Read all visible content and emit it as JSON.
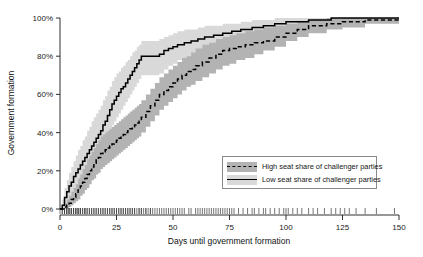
{
  "chart_data": {
    "type": "line",
    "title": "",
    "xlabel": "Days until government formation",
    "ylabel": "Government formation",
    "xlim": [
      0,
      150
    ],
    "ylim": [
      0,
      100
    ],
    "xticks": [
      0,
      25,
      50,
      75,
      100,
      125,
      150
    ],
    "xtick_labels": [
      "0",
      "25",
      "50",
      "75",
      "100",
      "125",
      "150"
    ],
    "yticks": [
      0,
      20,
      40,
      60,
      80,
      100
    ],
    "ytick_labels": [
      "0%",
      "20%",
      "40%",
      "60%",
      "80%",
      "100%"
    ],
    "grid": false,
    "legend_position": "lower-right",
    "step_shape": "hv",
    "rug_axis": "x-bottom",
    "series": [
      {
        "name": "High seat share of challenger parties",
        "style": "dashed",
        "color": "#000000",
        "band_color": "#b3b3b3",
        "x": [
          0,
          2,
          3,
          4,
          5,
          6,
          7,
          8,
          9,
          10,
          11,
          12,
          13,
          14,
          15,
          16,
          17,
          18,
          19,
          20,
          21,
          22,
          23,
          24,
          25,
          26,
          27,
          28,
          29,
          30,
          31,
          32,
          33,
          34,
          35,
          36,
          38,
          40,
          42,
          44,
          46,
          48,
          50,
          52,
          54,
          56,
          58,
          60,
          63,
          66,
          69,
          72,
          75,
          78,
          82,
          86,
          90,
          95,
          100,
          105,
          110,
          118,
          125,
          135,
          150
        ],
        "y": [
          0,
          1,
          2,
          3,
          5,
          6,
          8,
          10,
          12,
          14,
          16,
          18,
          20,
          22,
          24,
          26,
          27,
          29,
          30,
          31,
          32,
          33,
          34,
          35,
          36,
          37,
          38,
          39,
          40,
          41,
          42,
          43,
          44,
          45,
          46,
          48,
          51,
          54,
          57,
          60,
          62,
          64,
          66,
          68,
          70,
          72,
          73,
          75,
          77,
          79,
          81,
          83,
          84,
          85,
          86,
          87,
          88,
          90,
          92,
          94,
          96,
          97,
          98,
          99,
          100
        ],
        "band_lower": [
          0,
          0,
          0,
          1,
          2,
          3,
          4,
          5,
          7,
          8,
          10,
          11,
          13,
          15,
          16,
          18,
          19,
          21,
          22,
          23,
          24,
          25,
          26,
          27,
          28,
          29,
          30,
          31,
          32,
          33,
          34,
          35,
          36,
          37,
          38,
          40,
          43,
          46,
          49,
          52,
          54,
          56,
          58,
          60,
          62,
          64,
          65,
          67,
          69,
          71,
          73,
          75,
          76,
          78,
          79,
          81,
          83,
          85,
          88,
          90,
          92,
          94,
          95,
          97,
          98
        ],
        "band_upper": [
          0,
          3,
          5,
          7,
          9,
          11,
          13,
          16,
          18,
          21,
          23,
          26,
          28,
          30,
          32,
          34,
          36,
          38,
          39,
          40,
          41,
          42,
          43,
          44,
          45,
          46,
          47,
          48,
          49,
          50,
          51,
          52,
          53,
          54,
          55,
          57,
          60,
          63,
          66,
          69,
          71,
          73,
          75,
          77,
          79,
          80,
          82,
          84,
          86,
          87,
          89,
          90,
          91,
          92,
          93,
          94,
          95,
          96,
          97,
          98,
          99,
          100,
          100,
          100,
          100
        ]
      },
      {
        "name": "Low seat share of challenger parties",
        "style": "solid",
        "color": "#000000",
        "band_color": "#d9d9d9",
        "x": [
          0,
          1,
          2,
          3,
          4,
          5,
          6,
          7,
          8,
          9,
          10,
          11,
          12,
          13,
          14,
          15,
          16,
          17,
          18,
          19,
          20,
          21,
          22,
          23,
          24,
          25,
          26,
          27,
          28,
          29,
          30,
          31,
          32,
          33,
          34,
          35,
          36,
          37,
          38,
          40,
          42,
          44,
          46,
          48,
          50,
          52,
          55,
          58,
          61,
          64,
          68,
          72,
          76,
          80,
          85,
          90,
          95,
          100,
          110,
          120,
          125,
          135,
          150
        ],
        "y": [
          0,
          2,
          6,
          9,
          12,
          14,
          17,
          19,
          21,
          23,
          25,
          27,
          29,
          31,
          33,
          35,
          37,
          39,
          41,
          44,
          46,
          49,
          52,
          55,
          57,
          59,
          61,
          63,
          64,
          66,
          68,
          70,
          72,
          74,
          76,
          78,
          80,
          80,
          80,
          80,
          80,
          81,
          83,
          84,
          85,
          86,
          87,
          88,
          89,
          90,
          91,
          92,
          93,
          94,
          95,
          96,
          97,
          98,
          99,
          100,
          100,
          100,
          100
        ],
        "band_lower": [
          0,
          0,
          2,
          4,
          6,
          8,
          10,
          12,
          14,
          15,
          17,
          19,
          21,
          22,
          24,
          26,
          28,
          30,
          32,
          34,
          36,
          39,
          41,
          44,
          46,
          48,
          50,
          52,
          54,
          56,
          58,
          60,
          62,
          64,
          66,
          68,
          70,
          70,
          70,
          70,
          70,
          71,
          73,
          75,
          76,
          78,
          79,
          81,
          82,
          83,
          85,
          86,
          88,
          89,
          91,
          92,
          93,
          95,
          97,
          98,
          99,
          99,
          100
        ],
        "band_upper": [
          0,
          5,
          11,
          15,
          19,
          22,
          25,
          28,
          31,
          33,
          36,
          38,
          41,
          43,
          46,
          48,
          50,
          52,
          54,
          57,
          59,
          62,
          64,
          67,
          69,
          71,
          72,
          74,
          75,
          77,
          78,
          80,
          82,
          83,
          85,
          86,
          88,
          88,
          88,
          88,
          88,
          89,
          90,
          91,
          92,
          93,
          94,
          94,
          95,
          96,
          96,
          97,
          97,
          98,
          99,
          99,
          100,
          100,
          100,
          100,
          100,
          100,
          100
        ]
      }
    ],
    "rug_ticks": [
      0,
      1,
      1,
      2,
      2,
      2,
      3,
      3,
      3,
      4,
      4,
      4,
      5,
      5,
      5,
      6,
      6,
      6,
      7,
      7,
      7,
      8,
      8,
      8,
      9,
      9,
      9,
      10,
      10,
      11,
      11,
      11,
      12,
      12,
      13,
      13,
      14,
      14,
      15,
      15,
      16,
      16,
      17,
      17,
      18,
      18,
      19,
      19,
      20,
      20,
      21,
      21,
      22,
      22,
      23,
      23,
      24,
      24,
      25,
      25,
      26,
      26,
      27,
      27,
      28,
      28,
      29,
      29,
      30,
      30,
      31,
      31,
      32,
      32,
      33,
      33,
      34,
      35,
      35,
      36,
      36,
      37,
      38,
      38,
      39,
      40,
      40,
      41,
      42,
      43,
      44,
      45,
      46,
      47,
      48,
      49,
      50,
      51,
      52,
      53,
      54,
      55,
      57,
      58,
      60,
      61,
      62,
      63,
      64,
      65,
      66,
      67,
      68,
      69,
      70,
      71,
      72,
      73,
      74,
      75,
      76,
      77,
      79,
      81,
      83,
      85,
      86,
      88,
      90,
      91,
      93,
      95,
      97,
      99,
      100,
      101,
      103,
      105,
      107,
      110,
      112,
      114,
      117,
      120,
      122,
      124,
      126,
      128,
      131,
      135,
      140,
      148
    ]
  },
  "legend": {
    "entries": [
      {
        "label": "High seat share of challenger parties",
        "style": "dashed",
        "band_color": "#b3b3b3"
      },
      {
        "label": "Low seat share of challenger parties",
        "style": "solid",
        "band_color": "#d9d9d9"
      }
    ]
  }
}
